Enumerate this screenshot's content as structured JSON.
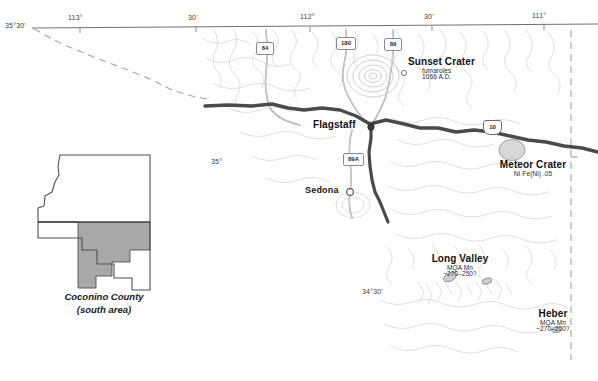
{
  "figure": {
    "background_color": "#ffffff",
    "width": 598,
    "height": 381
  },
  "colors": {
    "graticule_line": "#7d7d7d",
    "county_boundary": "#9a9a9a",
    "interstate": "#4d4d4d",
    "state_highway": "#8c8c8c",
    "hydrography": "#b9b9b9",
    "feature_fill": "#d6d6d6",
    "inset_outline": "#5a5a5a",
    "inset_shade": "#a6a6a6",
    "text": "#111111"
  },
  "graticule": {
    "top_labels": [
      {
        "text": "113°",
        "x": 80,
        "y": 22
      },
      {
        "text": "30'",
        "x": 192,
        "y": 22
      },
      {
        "text": "112°",
        "x": 303,
        "y": 22
      },
      {
        "text": "30'",
        "x": 428,
        "y": 22
      },
      {
        "text": "111°",
        "x": 536,
        "y": 22
      }
    ],
    "left_labels": [
      {
        "text": "35°30'",
        "x": 5,
        "y": 26
      },
      {
        "text": "35°",
        "x": 211,
        "y": 159
      },
      {
        "text": "34°30'",
        "x": 362,
        "y": 290
      }
    ]
  },
  "highways": {
    "shields": [
      {
        "label": "64",
        "type": "state",
        "x": 262,
        "y": 48
      },
      {
        "label": "180",
        "type": "state",
        "x": 343,
        "y": 43
      },
      {
        "label": "89",
        "type": "state",
        "x": 390,
        "y": 44
      },
      {
        "label": "89A",
        "type": "state",
        "x": 350,
        "y": 159
      },
      {
        "label": "10",
        "type": "interstate",
        "x": 489,
        "y": 126
      }
    ]
  },
  "places": [
    {
      "id": "sunset-crater",
      "name": "Sunset Crater",
      "sub1": "fumaroles",
      "sub2": "1066 A.D.",
      "label_x": 408,
      "label_y": 62,
      "marker_x": 404,
      "marker_y": 73
    },
    {
      "id": "flagstaff",
      "name": "Flagstaff",
      "sub1": "",
      "sub2": "",
      "label_x": 316,
      "label_y": 120,
      "marker_x": 371,
      "marker_y": 127
    },
    {
      "id": "sedona",
      "name": "Sedona",
      "sub1": "",
      "sub2": "",
      "label_x": 308,
      "label_y": 188,
      "marker_x": 350,
      "marker_y": 192
    },
    {
      "id": "meteor-crater",
      "name": "Meteor Crater",
      "sub1": "NI Fe(Ni) .05",
      "sub2": "",
      "label_x": 493,
      "label_y": 164,
      "marker_x": 512,
      "marker_y": 150
    },
    {
      "id": "long-valley",
      "name": "Long Valley",
      "sub1": "MQA Mn",
      "sub2": "~270–250?",
      "label_x": 448,
      "label_y": 258,
      "marker_x": 450,
      "marker_y": 277
    },
    {
      "id": "heber",
      "name": "Heber",
      "sub1": "MQA Mn",
      "sub2": "~270–250?",
      "label_x": 540,
      "label_y": 313,
      "marker_x": 556,
      "marker_y": 330
    }
  ],
  "inset": {
    "caption_line1": "Coconino County",
    "caption_line2": "(south area)",
    "caption_x": 104,
    "caption_y": 297
  }
}
